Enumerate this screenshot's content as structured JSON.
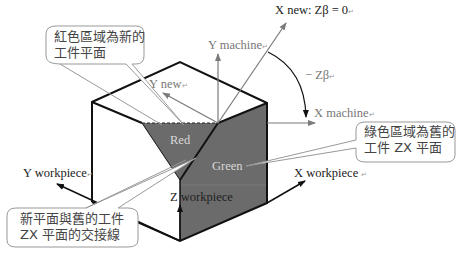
{
  "diagram": {
    "title": "",
    "axes": {
      "x_new": "X new: Zβ = 0",
      "y_machine": "Y machine",
      "y_new": "Y new",
      "minus_zbeta": "− Zβ",
      "x_machine": "X machine",
      "y_workpiece": "Y workpiece",
      "x_workpiece": "X workpiece",
      "z_workpiece": "Z workpiece"
    },
    "regions": {
      "red": "Red",
      "green": "Green"
    },
    "callouts": {
      "top_left": {
        "line1": "紅色區域為新的",
        "line2": "工件平面"
      },
      "right": {
        "line1": "綠色區域為舊的",
        "line2": "工件 ZX 平面"
      },
      "bottom_left": {
        "line1": "新平面與舊的工件",
        "line2": "ZX 平面的交接線"
      }
    },
    "paragraph_mark": "↵",
    "colors": {
      "region_fill": "#6b6b6b",
      "edge": "#111111",
      "axis_grey": "#8a8a8a",
      "callout_border": "#aaaaaa"
    }
  }
}
